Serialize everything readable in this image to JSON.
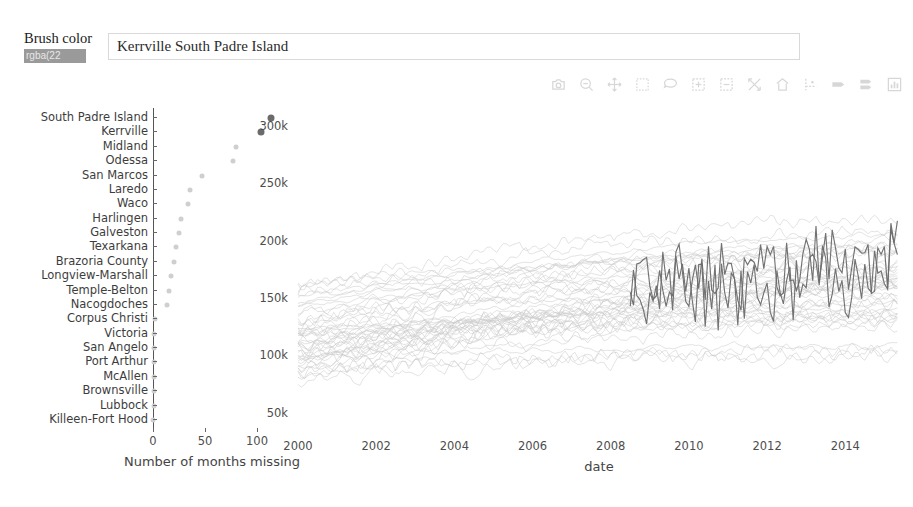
{
  "brush": {
    "label": "Brush color",
    "input_value": "rgba(22",
    "input_placeholder": "rgba(22, 22, 22, 1)",
    "swatch_color": "#9a9a9a"
  },
  "selection": {
    "text": "Kerrville  South Padre Island",
    "placeholder": "Selected cities"
  },
  "modebar": {
    "buttons": [
      {
        "name": "download-plot-as-png-icon",
        "title": "Download plot as a png"
      },
      {
        "name": "zoom-icon",
        "title": "Zoom"
      },
      {
        "name": "pan-icon",
        "title": "Pan"
      },
      {
        "name": "box-select-icon",
        "title": "Box Select"
      },
      {
        "name": "lasso-select-icon",
        "title": "Lasso Select"
      },
      {
        "name": "zoom-in-icon",
        "title": "Zoom in"
      },
      {
        "name": "zoom-out-icon",
        "title": "Zoom out"
      },
      {
        "name": "autoscale-icon",
        "title": "Autoscale"
      },
      {
        "name": "reset-axes-icon",
        "title": "Reset axes"
      },
      {
        "name": "toggle-spike-lines-icon",
        "title": "Toggle Spike Lines"
      },
      {
        "name": "hover-closest-icon",
        "title": "Show closest data on hover"
      },
      {
        "name": "hover-compare-icon",
        "title": "Compare data on hover"
      },
      {
        "name": "plotly-logo-icon",
        "title": "Produced with Plotly"
      }
    ]
  },
  "chart_data": [
    {
      "type": "scatter",
      "name": "missing-months-dotplot",
      "title": "",
      "xlabel": "Number of months missing",
      "ylabel": "",
      "xlim": [
        0,
        125
      ],
      "xticks": [
        0,
        50,
        100
      ],
      "grid": false,
      "categories": [
        "South Padre Island",
        "Kerrville",
        "Midland",
        "Odessa",
        "San Marcos",
        "Laredo",
        "Waco",
        "Harlingen",
        "Galveston",
        "Texarkana",
        "Brazoria County",
        "Longview-Marshall",
        "Temple-Belton",
        "Nacogdoches",
        "Corpus Christi",
        "Victoria",
        "San Angelo",
        "Port Arthur",
        "McAllen",
        "Brownsville",
        "Lubbock",
        "Killeen-Fort Hood"
      ],
      "values": [
        113,
        104,
        80,
        77,
        47,
        36,
        34,
        27,
        25,
        22,
        20,
        17,
        15,
        13,
        2,
        1,
        1,
        1,
        1,
        1,
        1,
        0
      ],
      "highlighted": [
        "South Padre Island",
        "Kerrville"
      ],
      "point_color": "#cfcfcf",
      "highlight_color": "#6b6b6b"
    },
    {
      "type": "line",
      "name": "home-price-timeseries",
      "title": "",
      "xlabel": "date",
      "ylabel": "",
      "xlim": [
        2000,
        2015.4
      ],
      "xticks": [
        2000,
        2002,
        2004,
        2006,
        2008,
        2010,
        2012,
        2014
      ],
      "xticklabels": [
        "2000",
        "2002",
        "2004",
        "2006",
        "2008",
        "2010",
        "2012",
        "2014"
      ],
      "ylim": [
        40000,
        315000
      ],
      "yticks": [
        50000,
        100000,
        150000,
        200000,
        250000,
        300000
      ],
      "yticklabels": [
        "50k",
        "100k",
        "150k",
        "200k",
        "250k",
        "300k"
      ],
      "grid": false,
      "legend": "none",
      "series_count": 46,
      "background_color": "#c9c9c9",
      "highlight_color": "#6b6b6b",
      "highlighted_series": [
        "Kerrville",
        "South Padre Island"
      ],
      "highlight_start_x": 2008.5,
      "notes": "Dense spaghetti of light-gray median-price series rising from ~80k-150k in 2000 to ~110k-250k by 2015; two dark highlighted, highly volatile series span 2008.5-2015."
    }
  ]
}
